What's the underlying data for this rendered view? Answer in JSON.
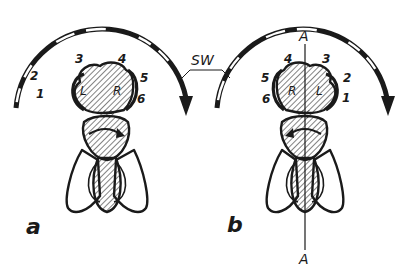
{
  "figure": {
    "panels": [
      {
        "id": "a",
        "label": "a",
        "eye_numbers": [
          "1",
          "2",
          "3",
          "4",
          "5",
          "6"
        ],
        "eye_labels": {
          "left": "L",
          "right": "R"
        }
      },
      {
        "id": "b",
        "label": "b",
        "eye_numbers": [
          "6",
          "5",
          "4",
          "3",
          "2",
          "1"
        ],
        "eye_labels": {
          "left": "R",
          "right": "L"
        },
        "axis_top": "A",
        "axis_bottom": "A"
      }
    ],
    "shared_label": "SW",
    "colors": {
      "ink": "#1a1a1a",
      "paper": "#ffffff"
    }
  }
}
